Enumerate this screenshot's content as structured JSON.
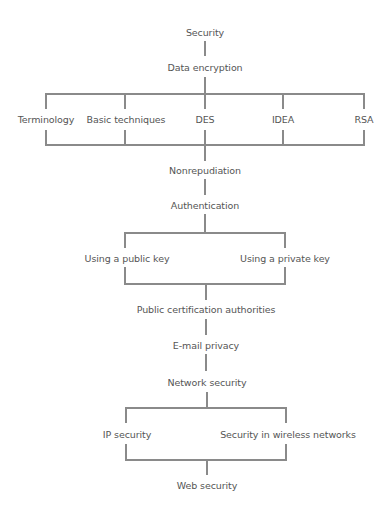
{
  "diagram": {
    "line_color": "#8a8a8a",
    "text_color": "#555555",
    "nodes": {
      "security": "Security",
      "data_encryption": "Data encryption",
      "terminology": "Terminology",
      "basic_techniques": "Basic techniques",
      "des": "DES",
      "idea": "IDEA",
      "rsa": "RSA",
      "nonrepudiation": "Nonrepudiation",
      "authentication": "Authentication",
      "public_key": "Using a public key",
      "private_key": "Using a private key",
      "public_cert": "Public certification authorities",
      "email_privacy": "E-mail privacy",
      "network_security": "Network security",
      "ip_security": "IP security",
      "wireless_security": "Security in wireless networks",
      "web_security": "Web security"
    },
    "edges": [
      [
        "Security",
        "Data encryption"
      ],
      [
        "Data encryption",
        "Terminology"
      ],
      [
        "Data encryption",
        "Basic techniques"
      ],
      [
        "Data encryption",
        "DES"
      ],
      [
        "Data encryption",
        "IDEA"
      ],
      [
        "Data encryption",
        "RSA"
      ],
      [
        "Terminology",
        "Nonrepudiation"
      ],
      [
        "Basic techniques",
        "Nonrepudiation"
      ],
      [
        "DES",
        "Nonrepudiation"
      ],
      [
        "IDEA",
        "Nonrepudiation"
      ],
      [
        "RSA",
        "Nonrepudiation"
      ],
      [
        "Nonrepudiation",
        "Authentication"
      ],
      [
        "Authentication",
        "Using a public key"
      ],
      [
        "Authentication",
        "Using a private key"
      ],
      [
        "Using a public key",
        "Public certification authorities"
      ],
      [
        "Using a private key",
        "Public certification authorities"
      ],
      [
        "Public certification authorities",
        "E-mail privacy"
      ],
      [
        "E-mail privacy",
        "Network security"
      ],
      [
        "Network security",
        "IP security"
      ],
      [
        "Network security",
        "Security in wireless networks"
      ],
      [
        "IP security",
        "Web security"
      ],
      [
        "Security in wireless networks",
        "Web security"
      ]
    ]
  }
}
